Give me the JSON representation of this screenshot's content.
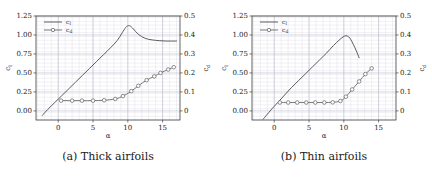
{
  "figure": {
    "panels": [
      {
        "caption": "(a) Thick airfoils",
        "legend": {
          "cl": "c",
          "cl_sub": "l",
          "cd": "c",
          "cd_sub": "d"
        },
        "xlabel": "α",
        "ylabel_left": "c",
        "ylabel_left_sub": "l",
        "ylabel_right": "c",
        "ylabel_right_sub": "d",
        "xticks": [
          "0",
          "5",
          "10",
          "15"
        ],
        "yticks_left": [
          "0.00",
          "0.25",
          "0.50",
          "0.75",
          "1.00",
          "1.25"
        ],
        "yticks_right": [
          "0",
          "0.1",
          "0.2",
          "0.3",
          "0.4",
          "0.5"
        ]
      },
      {
        "caption": "(b) Thin airfoils",
        "legend": {
          "cl": "c",
          "cl_sub": "l",
          "cd": "c",
          "cd_sub": "d"
        },
        "xlabel": "α",
        "ylabel_left": "c",
        "ylabel_left_sub": "l",
        "ylabel_right": "c",
        "ylabel_right_sub": "d",
        "xticks": [
          "0",
          "5",
          "10",
          "15"
        ],
        "yticks_left": [
          "0.00",
          "0.25",
          "0.50",
          "0.75",
          "1.00",
          "1.25"
        ],
        "yticks_right": [
          "0",
          "0.1",
          "0.2",
          "0.3",
          "0.4",
          "0.5"
        ]
      }
    ],
    "colors": {
      "line": "#4a4a4a",
      "grid_major": "#b8b8c8",
      "grid_minor": "#dcdce6",
      "frame": "#404040",
      "marker_face": "#ffffff",
      "marker_edge": "#6a6a6a",
      "text": "#1a1a1a"
    }
  },
  "chart_data": [
    {
      "type": "line",
      "title": "(a) Thick airfoils",
      "xlabel": "alpha",
      "ylabel": "c_l",
      "ylabel_right": "c_d",
      "xlim": [
        -3.2,
        17.5
      ],
      "ylim": [
        -0.12,
        1.25
      ],
      "ylim_right": [
        -0.048,
        0.5
      ],
      "grid": true,
      "legend_position": "upper left",
      "series": [
        {
          "name": "c_l",
          "axis": "left",
          "marker": "none",
          "x": [
            -2.3,
            -1.5,
            -0.5,
            0.5,
            1.5,
            2.5,
            3.5,
            4.5,
            5.5,
            6.5,
            7.5,
            8.5,
            9.2,
            9.7,
            10.0,
            10.3,
            10.8,
            11.5,
            12.5,
            13.5,
            14.5,
            15.5,
            16.5,
            17.0
          ],
          "y": [
            -0.06,
            0.02,
            0.11,
            0.2,
            0.29,
            0.38,
            0.47,
            0.56,
            0.65,
            0.74,
            0.83,
            0.93,
            1.03,
            1.1,
            1.12,
            1.12,
            1.08,
            1.01,
            0.955,
            0.935,
            0.925,
            0.92,
            0.92,
            0.92
          ]
        },
        {
          "name": "c_d",
          "axis": "right",
          "marker": "circle",
          "x": [
            0.4,
            2.0,
            3.4,
            5.0,
            6.6,
            8.2,
            9.3,
            10.5,
            11.5,
            12.7,
            13.8,
            14.7,
            15.8,
            16.6
          ],
          "y": [
            0.054,
            0.054,
            0.054,
            0.054,
            0.056,
            0.063,
            0.078,
            0.104,
            0.132,
            0.162,
            0.182,
            0.2,
            0.218,
            0.23
          ]
        }
      ]
    },
    {
      "type": "line",
      "title": "(b) Thin airfoils",
      "xlabel": "alpha",
      "ylabel": "c_l",
      "ylabel_right": "c_d",
      "xlim": [
        -3.2,
        17.5
      ],
      "ylim": [
        -0.12,
        1.25
      ],
      "ylim_right": [
        -0.048,
        0.5
      ],
      "grid": true,
      "legend_position": "upper left",
      "series": [
        {
          "name": "c_l",
          "axis": "left",
          "marker": "none",
          "x": [
            -1.6,
            -0.5,
            0.5,
            1.5,
            2.5,
            3.5,
            4.5,
            5.5,
            6.5,
            7.5,
            8.5,
            9.3,
            9.9,
            10.3,
            10.7,
            11.0,
            11.4,
            11.8,
            12.2
          ],
          "y": [
            -0.11,
            0.01,
            0.11,
            0.21,
            0.31,
            0.4,
            0.49,
            0.58,
            0.67,
            0.76,
            0.86,
            0.93,
            0.975,
            0.99,
            0.975,
            0.94,
            0.87,
            0.79,
            0.7
          ]
        },
        {
          "name": "c_d",
          "axis": "right",
          "marker": "circle",
          "x": [
            0.8,
            2.0,
            3.3,
            4.6,
            5.9,
            7.2,
            8.4,
            9.5,
            10.3,
            11.2,
            12.2,
            13.1,
            14.0
          ],
          "y": [
            0.044,
            0.044,
            0.044,
            0.044,
            0.044,
            0.044,
            0.045,
            0.052,
            0.075,
            0.113,
            0.155,
            0.194,
            0.224
          ]
        }
      ]
    }
  ]
}
